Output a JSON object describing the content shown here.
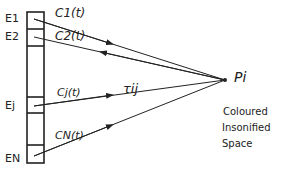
{
  "diagram": {
    "emitters": [
      {
        "label": "E1",
        "signal": "C1(t)"
      },
      {
        "label": "E2",
        "signal": "C2(t)"
      },
      {
        "label": "Ej",
        "signal": "Cj(t)"
      },
      {
        "label": "EN",
        "signal": "CN(t)"
      }
    ],
    "delay_label": "τij",
    "point_label": "Pi",
    "space_label": [
      "Coloured",
      "Insonified",
      "Space"
    ]
  }
}
